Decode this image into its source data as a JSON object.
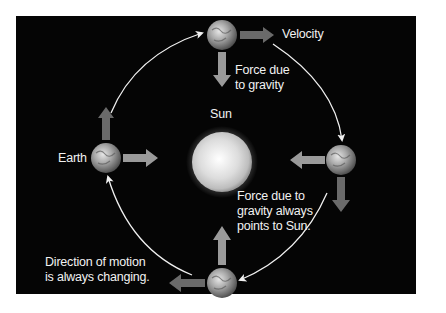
{
  "diagram": {
    "labels": {
      "velocity": "Velocity",
      "force_top_line1": "Force due",
      "force_top_line2": "to gravity",
      "sun": "Sun",
      "earth": "Earth",
      "force_always_line1": "Force due to",
      "force_always_line2": "gravity always",
      "force_always_line3": "points to Sun.",
      "direction_line1": "Direction of motion",
      "direction_line2": "is always changing."
    },
    "colors": {
      "background": "#050505",
      "velocity_arrow": "#6a6a6a",
      "gravity_arrow": "#9a9a9a",
      "orbit_line": "#f0f0f0",
      "text": "#f2f2f2",
      "sun": "#e8e8e8"
    },
    "nodes": [
      {
        "id": "sun",
        "label": "Sun",
        "x": 222,
        "y": 162
      },
      {
        "id": "earth-top",
        "x": 222,
        "y": 35
      },
      {
        "id": "earth-right",
        "x": 341,
        "y": 160
      },
      {
        "id": "earth-bottom",
        "x": 222,
        "y": 283
      },
      {
        "id": "earth-left",
        "label": "Earth",
        "x": 106,
        "y": 158
      }
    ],
    "edges": [
      {
        "from": "earth-top",
        "to": "earth-right",
        "type": "orbit"
      },
      {
        "from": "earth-right",
        "to": "earth-bottom",
        "type": "orbit"
      },
      {
        "from": "earth-bottom",
        "to": "earth-left",
        "type": "orbit"
      },
      {
        "from": "earth-left",
        "to": "earth-top",
        "type": "orbit"
      },
      {
        "from": "earth-top",
        "to": "sun",
        "type": "gravity"
      },
      {
        "from": "earth-right",
        "to": "sun",
        "type": "gravity"
      },
      {
        "from": "earth-bottom",
        "to": "sun",
        "type": "gravity"
      },
      {
        "from": "earth-left",
        "to": "sun",
        "type": "gravity"
      }
    ]
  }
}
